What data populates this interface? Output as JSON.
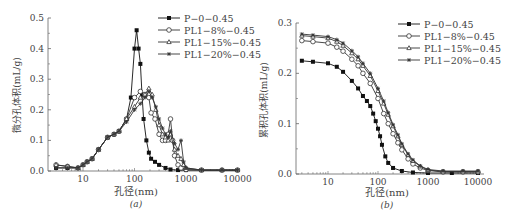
{
  "chart_data": [
    {
      "type": "line",
      "panel_label": "(a)",
      "ylabel": "微分孔体积(mL/g)",
      "xlabel": "孔径(nm)",
      "xscale": "log",
      "xlim": [
        3,
        10000
      ],
      "ylim": [
        0,
        0.5
      ],
      "xticks": [
        10,
        100,
        1000,
        10000
      ],
      "xtick_labels": [
        "10",
        "100",
        "1000",
        "10000"
      ],
      "yticks": [
        0.0,
        0.1,
        0.2,
        0.3,
        0.4,
        0.5
      ],
      "ytick_labels": [
        "0.0",
        "0.1",
        "0.2",
        "0.3",
        "0.4",
        "0.5"
      ],
      "legend_position": "top-right",
      "series": [
        {
          "name": "P−0−0.45",
          "marker": "filled-square",
          "x": [
            3,
            5,
            8,
            10,
            12,
            15,
            20,
            30,
            40,
            50,
            70,
            85,
            100,
            110,
            120,
            130,
            140,
            150,
            170,
            190,
            210,
            250,
            300,
            400,
            500,
            700,
            1000,
            2000,
            5000,
            10000
          ],
          "y": [
            0.01,
            0.01,
            0.01,
            0.02,
            0.03,
            0.04,
            0.07,
            0.11,
            0.12,
            0.13,
            0.17,
            0.24,
            0.4,
            0.46,
            0.4,
            0.35,
            0.25,
            0.17,
            0.1,
            0.06,
            0.04,
            0.03,
            0.02,
            0.01,
            0.005,
            0.003,
            0.003,
            0.003,
            0.003,
            0.003
          ]
        },
        {
          "name": "PL1−8%−0.45",
          "marker": "open-circle",
          "x": [
            3,
            5,
            8,
            10,
            12,
            15,
            20,
            30,
            40,
            50,
            70,
            100,
            130,
            160,
            190,
            210,
            250,
            300,
            350,
            400,
            450,
            500,
            550,
            600,
            700,
            800,
            1000,
            2000,
            5000,
            10000
          ],
          "y": [
            0.02,
            0.015,
            0.01,
            0.02,
            0.03,
            0.04,
            0.07,
            0.11,
            0.12,
            0.13,
            0.17,
            0.24,
            0.26,
            0.25,
            0.24,
            0.19,
            0.17,
            0.12,
            0.1,
            0.1,
            0.12,
            0.17,
            0.1,
            0.05,
            0.02,
            0.01,
            0.005,
            0.003,
            0.003,
            0.003
          ]
        },
        {
          "name": "PL1−15%−0.45",
          "marker": "open-triangle",
          "x": [
            3,
            5,
            8,
            10,
            12,
            15,
            20,
            30,
            40,
            50,
            70,
            100,
            130,
            160,
            190,
            220,
            260,
            300,
            350,
            400,
            450,
            500,
            600,
            700,
            800,
            900,
            1000,
            2000,
            5000,
            10000
          ],
          "y": [
            0.02,
            0.015,
            0.01,
            0.02,
            0.03,
            0.04,
            0.07,
            0.11,
            0.12,
            0.13,
            0.17,
            0.21,
            0.24,
            0.25,
            0.27,
            0.25,
            0.2,
            0.15,
            0.12,
            0.11,
            0.1,
            0.12,
            0.07,
            0.05,
            0.04,
            0.02,
            0.01,
            0.003,
            0.003,
            0.003
          ]
        },
        {
          "name": "PL1−20%−0.45",
          "marker": "star",
          "x": [
            3,
            5,
            8,
            10,
            12,
            15,
            20,
            30,
            40,
            50,
            70,
            100,
            130,
            160,
            190,
            220,
            260,
            300,
            350,
            400,
            450,
            500,
            600,
            700,
            800,
            900,
            1000,
            2000,
            5000,
            10000
          ],
          "y": [
            0.01,
            0.01,
            0.01,
            0.02,
            0.03,
            0.04,
            0.07,
            0.11,
            0.12,
            0.13,
            0.16,
            0.2,
            0.22,
            0.24,
            0.26,
            0.24,
            0.21,
            0.17,
            0.14,
            0.12,
            0.11,
            0.13,
            0.09,
            0.07,
            0.1,
            0.03,
            0.01,
            0.003,
            0.003,
            0.003
          ]
        }
      ]
    },
    {
      "type": "line",
      "panel_label": "(b)",
      "ylabel": "累积孔体积(mL/g)",
      "xlabel": "孔径(nm)",
      "xscale": "log",
      "xlim": [
        2,
        10000
      ],
      "ylim": [
        0,
        0.3
      ],
      "xticks": [
        10,
        100,
        1000,
        10000
      ],
      "xtick_labels": [
        "10",
        "100",
        "1000",
        "10000"
      ],
      "yticks": [
        0.0,
        0.1,
        0.2,
        0.3
      ],
      "ytick_labels": [
        "0.0",
        "0.1",
        "0.2",
        "0.3"
      ],
      "legend_position": "top-right",
      "series": [
        {
          "name": "P−0−0.45",
          "marker": "filled-square",
          "x": [
            3,
            5,
            10,
            15,
            20,
            30,
            40,
            50,
            60,
            70,
            80,
            90,
            100,
            110,
            120,
            140,
            160,
            200,
            300,
            500,
            1000,
            3000,
            10000
          ],
          "y": [
            0.225,
            0.223,
            0.22,
            0.213,
            0.203,
            0.185,
            0.17,
            0.155,
            0.145,
            0.135,
            0.12,
            0.105,
            0.09,
            0.075,
            0.058,
            0.035,
            0.022,
            0.012,
            0.006,
            0.003,
            0.002,
            0.002,
            0.002
          ]
        },
        {
          "name": "PL1−8%−0.45",
          "marker": "open-circle",
          "x": [
            3,
            5,
            10,
            15,
            20,
            30,
            40,
            50,
            70,
            100,
            130,
            160,
            200,
            250,
            300,
            400,
            500,
            700,
            1000,
            2000,
            5000,
            10000
          ],
          "y": [
            0.265,
            0.263,
            0.26,
            0.252,
            0.244,
            0.228,
            0.215,
            0.2,
            0.18,
            0.15,
            0.12,
            0.1,
            0.08,
            0.062,
            0.048,
            0.03,
            0.02,
            0.012,
            0.007,
            0.004,
            0.004,
            0.004
          ]
        },
        {
          "name": "PL1−15%−0.45",
          "marker": "open-triangle",
          "x": [
            3,
            5,
            10,
            15,
            20,
            30,
            40,
            50,
            70,
            100,
            130,
            160,
            200,
            250,
            300,
            400,
            500,
            700,
            1000,
            2000,
            5000,
            10000
          ],
          "y": [
            0.275,
            0.273,
            0.27,
            0.263,
            0.255,
            0.24,
            0.228,
            0.215,
            0.195,
            0.165,
            0.14,
            0.118,
            0.095,
            0.075,
            0.058,
            0.038,
            0.026,
            0.015,
            0.008,
            0.005,
            0.005,
            0.005
          ]
        },
        {
          "name": "PL1−20%−0.45",
          "marker": "star",
          "x": [
            3,
            5,
            10,
            15,
            20,
            30,
            40,
            50,
            70,
            100,
            130,
            160,
            200,
            250,
            300,
            400,
            500,
            700,
            1000,
            2000,
            5000,
            10000
          ],
          "y": [
            0.278,
            0.276,
            0.273,
            0.267,
            0.26,
            0.245,
            0.233,
            0.22,
            0.2,
            0.17,
            0.145,
            0.122,
            0.098,
            0.078,
            0.06,
            0.04,
            0.028,
            0.016,
            0.009,
            0.006,
            0.006,
            0.006
          ]
        }
      ]
    }
  ]
}
